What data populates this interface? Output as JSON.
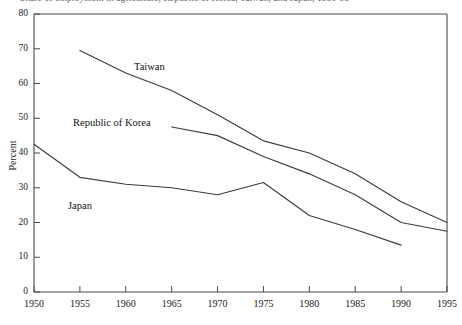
{
  "figure": {
    "title": "Share of employment in agriculture, Republic of Korea, Taiwan, and Japan, 1950-95",
    "ylabel": "Percent"
  },
  "chart_data": {
    "type": "line",
    "title": "Share of employment in agriculture, Republic of Korea, Taiwan, and Japan, 1950-95",
    "xlabel": "",
    "ylabel": "Percent",
    "xlim": [
      1950,
      1995
    ],
    "ylim": [
      0,
      80
    ],
    "grid": false,
    "legend": "inline-labels",
    "xticks": [
      1950,
      1955,
      1960,
      1965,
      1970,
      1975,
      1980,
      1985,
      1990,
      1995
    ],
    "yticks": [
      0,
      10,
      20,
      30,
      40,
      50,
      60,
      70,
      80
    ],
    "series": [
      {
        "name": "Taiwan",
        "x": [
          1955,
          1960,
          1965,
          1970,
          1975,
          1980,
          1985,
          1990,
          1995
        ],
        "values": [
          69.5,
          63.0,
          58.0,
          51.0,
          43.5,
          40.0,
          34.0,
          26.0,
          20.0
        ]
      },
      {
        "name": "Republic of Korea",
        "x": [
          1965,
          1970,
          1975,
          1980,
          1985,
          1990,
          1995
        ],
        "values": [
          47.5,
          45.0,
          39.0,
          34.0,
          28.0,
          20.0,
          17.5
        ]
      },
      {
        "name": "Japan",
        "x": [
          1950,
          1955,
          1960,
          1965,
          1970,
          1975,
          1980,
          1985,
          1990
        ],
        "values": [
          42.5,
          33.0,
          31.0,
          30.0,
          28.0,
          31.5,
          22.0,
          18.0,
          13.5
        ]
      }
    ]
  },
  "axes": {
    "x_tick_labels": [
      "1950",
      "1955",
      "1960",
      "1965",
      "1970",
      "1975",
      "1980",
      "1985",
      "1990",
      "1995"
    ],
    "y_tick_labels": [
      "80",
      "70",
      "60",
      "50",
      "40",
      "30",
      "20",
      "10",
      "0"
    ]
  },
  "series_labels": [
    {
      "name": "Taiwan",
      "text": "Taiwan"
    },
    {
      "name": "Republic of Korea",
      "text": "Republic of Korea"
    },
    {
      "name": "Japan",
      "text": "Japan"
    }
  ]
}
